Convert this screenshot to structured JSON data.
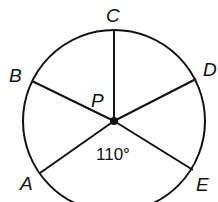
{
  "diagram": {
    "type": "circle-with-radii",
    "center": {
      "label": "P",
      "x": 114,
      "y": 121
    },
    "radius": 91,
    "points": [
      {
        "label": "C",
        "x": 114,
        "y": 30,
        "label_x": 106,
        "label_y": 22
      },
      {
        "label": "B",
        "x": 32,
        "y": 81,
        "label_x": 9,
        "label_y": 82
      },
      {
        "label": "D",
        "x": 196,
        "y": 79,
        "label_x": 203,
        "label_y": 76
      },
      {
        "label": "A",
        "x": 40,
        "y": 173,
        "label_x": 20,
        "label_y": 190
      },
      {
        "label": "E",
        "x": 193,
        "y": 170,
        "label_x": 196,
        "label_y": 191
      }
    ],
    "angle_label": {
      "text": "110°",
      "between": [
        "A",
        "E"
      ],
      "x": 96,
      "y": 160
    },
    "stroke_color": "#111111"
  }
}
